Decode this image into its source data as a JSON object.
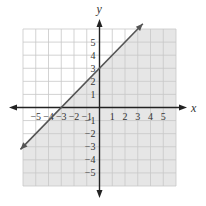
{
  "chart_data": {
    "type": "line",
    "title": "",
    "xlabel": "x",
    "ylabel": "y",
    "xlim": [
      -6,
      6
    ],
    "ylim": [
      -6,
      6
    ],
    "grid": true,
    "x_ticks": [
      -5,
      -4,
      -3,
      -2,
      -1,
      1,
      2,
      3,
      4,
      5
    ],
    "y_ticks": [
      -5,
      -4,
      -3,
      -2,
      -1,
      1,
      2,
      3,
      4,
      5
    ],
    "x_tick_labels": [
      "−5",
      "−4",
      "−3",
      "−2",
      "−1",
      "1",
      "2",
      "3",
      "4",
      "5"
    ],
    "y_tick_labels": [
      "−5",
      "−4",
      "−3",
      "−2",
      "−1",
      "1",
      "2",
      "3",
      "4",
      "5"
    ],
    "series": [
      {
        "name": "boundary line y = x + 3",
        "slope": 1,
        "intercept": 3,
        "x": [
          -6.2,
          3.4
        ],
        "y": [
          -3.2,
          6.4
        ],
        "style": "solid",
        "arrows": "both"
      }
    ],
    "shaded_region": {
      "description": "region below/right of the line",
      "inequality": "y < x + 3",
      "color": "#e6e6e6"
    },
    "colors": {
      "grid": "#c8c8c8",
      "axis": "#222222",
      "line": "#555555",
      "shade": "#e6e6e6",
      "unshaded": "#ffffff"
    }
  }
}
